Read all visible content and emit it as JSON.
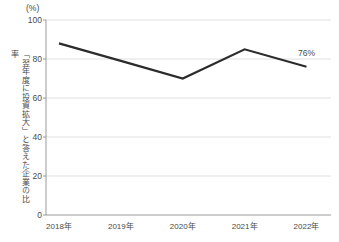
{
  "chart": {
    "unit_label": "(%)",
    "y_axis_title": "「翌年度に投資拡大」と答えた企業の比率",
    "endpoint_annotation": "76%"
  },
  "chart_data": {
    "type": "line",
    "categories": [
      "2018年",
      "2019年",
      "2020年",
      "2021年",
      "2022年"
    ],
    "values": [
      88,
      79,
      70,
      85,
      76
    ],
    "title": "",
    "xlabel": "",
    "ylabel": "「翌年度に投資拡大」と答えた企業の比率",
    "unit_label": "(%)",
    "ylim": [
      0,
      100
    ],
    "yticks": [
      0,
      20,
      40,
      60,
      80,
      100
    ],
    "grid": true,
    "legend": false,
    "annotation": {
      "text": "76%",
      "point_index": 4
    },
    "colors": {
      "line": "#2b2b2b",
      "grid": "#e0e0e0",
      "axis": "#9a9a9a",
      "text": "#4a4a4a"
    }
  }
}
